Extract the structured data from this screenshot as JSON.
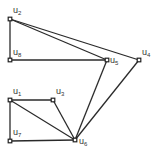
{
  "graph": {
    "nodes": [
      {
        "id": "u2",
        "label": "u",
        "sub": "2",
        "x": 10,
        "y": 19,
        "lx": 13,
        "ly": 13
      },
      {
        "id": "u8",
        "label": "u",
        "sub": "8",
        "x": 10,
        "y": 60,
        "lx": 13,
        "ly": 55
      },
      {
        "id": "u5",
        "label": "u",
        "sub": "5",
        "x": 107,
        "y": 60,
        "lx": 110,
        "ly": 63
      },
      {
        "id": "u4",
        "label": "u",
        "sub": "4",
        "x": 139,
        "y": 60,
        "lx": 142,
        "ly": 55
      },
      {
        "id": "u1",
        "label": "u",
        "sub": "1",
        "x": 10,
        "y": 100,
        "lx": 13,
        "ly": 94
      },
      {
        "id": "u3",
        "label": "u",
        "sub": "3",
        "x": 53,
        "y": 100,
        "lx": 56,
        "ly": 94
      },
      {
        "id": "u7",
        "label": "u",
        "sub": "7",
        "x": 10,
        "y": 141,
        "lx": 13,
        "ly": 135
      },
      {
        "id": "u6",
        "label": "u",
        "sub": "6",
        "x": 75,
        "y": 140,
        "lx": 79,
        "ly": 144
      }
    ],
    "edges": [
      [
        "u2",
        "u8"
      ],
      [
        "u2",
        "u5"
      ],
      [
        "u2",
        "u4"
      ],
      [
        "u8",
        "u5"
      ],
      [
        "u5",
        "u6"
      ],
      [
        "u4",
        "u6"
      ],
      [
        "u1",
        "u3"
      ],
      [
        "u1",
        "u6"
      ],
      [
        "u1",
        "u7"
      ],
      [
        "u3",
        "u6"
      ],
      [
        "u7",
        "u6"
      ]
    ]
  }
}
